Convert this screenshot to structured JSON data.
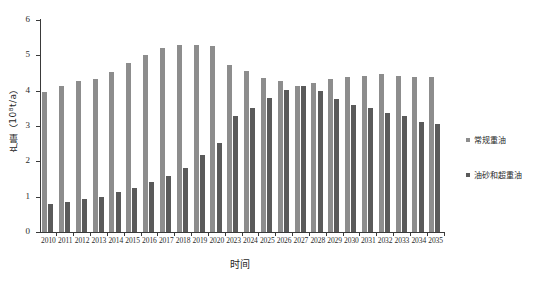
{
  "chart_data": {
    "type": "bar",
    "title": "",
    "xlabel": "时间",
    "ylabel": "产量（10⁸t/a）",
    "ylim": [
      0,
      6
    ],
    "yticks": [
      0,
      1,
      2,
      3,
      4,
      5,
      6
    ],
    "ytick_labels": [
      "0",
      "1",
      "2",
      "3",
      "4",
      "5",
      "6"
    ],
    "grid": false,
    "legend_position": "right",
    "categories": [
      "2010",
      "2011",
      "2012",
      "2013",
      "2014",
      "2015",
      "2016",
      "2017",
      "2018",
      "2019",
      "2020",
      "2023",
      "2024",
      "2025",
      "2026",
      "2027",
      "2028",
      "2029",
      "2030",
      "2031",
      "2032",
      "2033",
      "2034",
      "2035"
    ],
    "series": [
      {
        "name": "常规重油",
        "color": "#8d8d8d",
        "values": [
          3.97,
          4.14,
          4.26,
          4.33,
          4.54,
          4.79,
          5.02,
          5.22,
          5.28,
          5.28,
          5.27,
          4.72,
          4.55,
          4.35,
          4.28,
          4.14,
          4.23,
          4.33,
          4.4,
          4.42,
          4.47,
          4.42,
          4.38,
          4.38
        ]
      },
      {
        "name": "油砂和超重油",
        "color": "#5a5a5a",
        "values": [
          0.78,
          0.86,
          0.93,
          0.99,
          1.13,
          1.24,
          1.42,
          1.58,
          1.8,
          2.17,
          2.52,
          3.27,
          3.5,
          3.8,
          4.01,
          4.13,
          3.98,
          3.77,
          3.6,
          3.52,
          3.36,
          3.28,
          3.12,
          3.06
        ]
      }
    ]
  },
  "legend": {
    "items": [
      {
        "label": "常规重油"
      },
      {
        "label": "油砂和超重油"
      }
    ]
  }
}
